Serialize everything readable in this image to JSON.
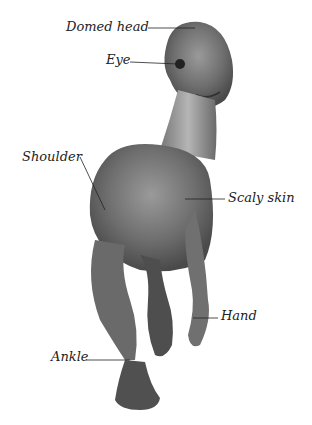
{
  "diagram": {
    "labels": [
      {
        "text": "Domed head"
      },
      {
        "text": "Eye"
      },
      {
        "text": "Shoulder"
      },
      {
        "text": "Scaly skin"
      },
      {
        "text": "Hand"
      },
      {
        "text": "Ankle"
      }
    ]
  }
}
